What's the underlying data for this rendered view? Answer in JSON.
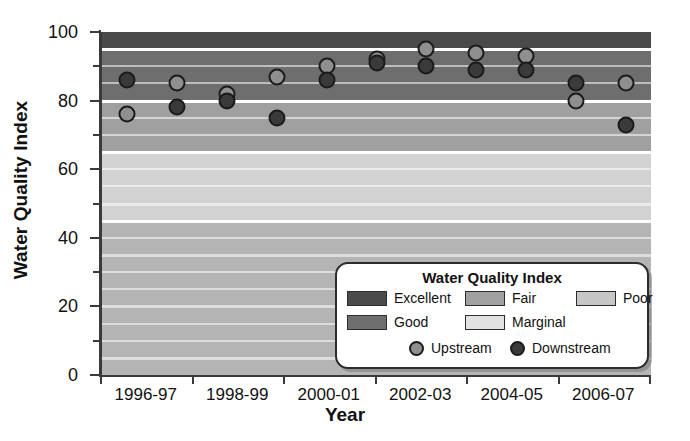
{
  "chart_data": {
    "type": "scatter",
    "title": "",
    "xlabel": "Year",
    "ylabel": "Water Quality Index",
    "ylim": [
      0,
      100
    ],
    "y_major_ticks": [
      0,
      20,
      40,
      60,
      80,
      100
    ],
    "y_minor_ticks": [
      10,
      30,
      50,
      70,
      90
    ],
    "grid": true,
    "legend_position": "inside-bottom-right",
    "categories": [
      "1996-97",
      "1997-98",
      "1998-99",
      "1999-00",
      "2000-01",
      "2001-02",
      "2002-03",
      "2003-04",
      "2004-05",
      "2005-06",
      "2006-07"
    ],
    "series": [
      {
        "name": "Upstream",
        "color": "#8f8f8f",
        "marker": "circle-light",
        "points": [
          {
            "category": "1996-97",
            "x": 0.5,
            "value": 76
          },
          {
            "category": "1997-98",
            "x": 1.5,
            "value": 85
          },
          {
            "category": "1998-99",
            "x": 2.5,
            "value": 82
          },
          {
            "category": "1999-00",
            "x": 3.5,
            "value": 87
          },
          {
            "category": "2000-01",
            "x": 4.5,
            "value": 90
          },
          {
            "category": "2001-02",
            "x": 5.5,
            "value": 92
          },
          {
            "category": "2002-03",
            "x": 6.5,
            "value": 95
          },
          {
            "category": "2003-04",
            "x": 7.5,
            "value": 94
          },
          {
            "category": "2004-05",
            "x": 8.5,
            "value": 93
          },
          {
            "category": "2005-06",
            "x": 9.5,
            "value": 80
          },
          {
            "category": "2006-07",
            "x": 10.5,
            "value": 85
          }
        ]
      },
      {
        "name": "Downstream",
        "color": "#3a3a3a",
        "marker": "circle-dark",
        "points": [
          {
            "category": "1996-97",
            "x": 0.5,
            "value": 86
          },
          {
            "category": "1997-98",
            "x": 1.5,
            "value": 78
          },
          {
            "category": "1998-99",
            "x": 2.5,
            "value": 80
          },
          {
            "category": "1999-00",
            "x": 3.5,
            "value": 75
          },
          {
            "category": "2000-01",
            "x": 4.5,
            "value": 86
          },
          {
            "category": "2001-02",
            "x": 5.5,
            "value": 91
          },
          {
            "category": "2002-03",
            "x": 6.5,
            "value": 90
          },
          {
            "category": "2003-04",
            "x": 7.5,
            "value": 89
          },
          {
            "category": "2004-05",
            "x": 8.5,
            "value": 89
          },
          {
            "category": "2005-06",
            "x": 9.5,
            "value": 85
          },
          {
            "category": "2006-07",
            "x": 10.5,
            "value": 73
          }
        ]
      }
    ],
    "bands": [
      {
        "label": "Excellent",
        "min": 95,
        "max": 100,
        "color": "#4a4a4a"
      },
      {
        "label": "Good",
        "min": 80,
        "max": 95,
        "color": "#6e6e6e"
      },
      {
        "label": "Fair",
        "min": 65,
        "max": 80,
        "color": "#a0a0a0"
      },
      {
        "label": "Marginal",
        "min": 45,
        "max": 65,
        "color": "#d2d2d2"
      },
      {
        "label": "Poor",
        "min": 0,
        "max": 45,
        "color": "#b4b4b4"
      }
    ]
  },
  "axes": {
    "y_title": "Water Quality Index",
    "x_title": "Year",
    "y_tick_labels": [
      "0",
      "20",
      "40",
      "60",
      "80",
      "100"
    ],
    "x_tick_labels": [
      "1996-97",
      "1998-99",
      "2000-01",
      "2002-03",
      "2004-05",
      "2006-07"
    ]
  },
  "legend": {
    "title": "Water Quality Index",
    "band_entries": [
      {
        "label": "Excellent",
        "color": "#4a4a4a"
      },
      {
        "label": "Good",
        "color": "#6e6e6e"
      },
      {
        "label": "Fair",
        "color": "#a0a0a0"
      },
      {
        "label": "Marginal",
        "color": "#e2e2e2"
      },
      {
        "label": "Poor",
        "color": "#c6c6c6"
      }
    ],
    "marker_entries": [
      {
        "label": "Upstream",
        "color": "#8f8f8f"
      },
      {
        "label": "Downstream",
        "color": "#3a3a3a"
      }
    ]
  }
}
